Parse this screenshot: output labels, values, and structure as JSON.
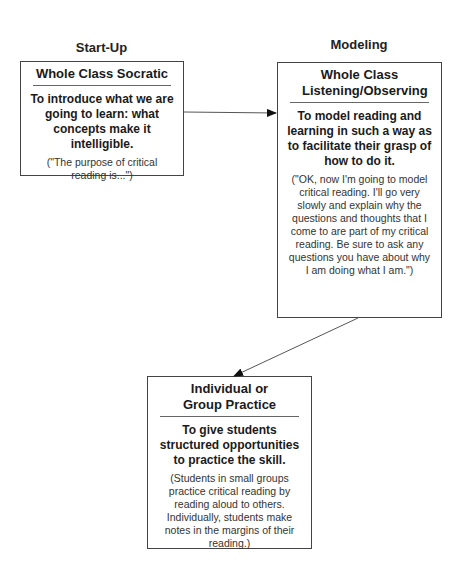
{
  "phases": {
    "startup": "Start-Up",
    "modeling": "Modeling"
  },
  "boxes": [
    {
      "title": "Whole Class Socratic",
      "goal": "To introduce what we are going to learn: what concepts make it intelligible.",
      "example": "(\"The purpose of critical reading is...\")"
    },
    {
      "title": "Whole Class Listening/Observing",
      "goal": "To model reading and learning in such a way as to facilitate their grasp of how to do it.",
      "example": "(\"OK, now I'm going to model critical reading. I'll go very slowly and explain why the questions and thoughts that I come to are part of my critical reading. Be sure to ask any questions you have about why I am doing what I am.\")"
    },
    {
      "title": "Individual or Group Practice",
      "goal": "To give students structured opportunities to practice the skill.",
      "example": "(Students in small groups practice critical reading by reading aloud to others. Individually, students make notes in the margins of their reading.)"
    }
  ],
  "connections": [
    {
      "from": "Whole Class Socratic",
      "to": "Whole Class Listening/Observing"
    },
    {
      "from": "Whole Class Listening/Observing",
      "to": "Individual or Group Practice"
    }
  ]
}
